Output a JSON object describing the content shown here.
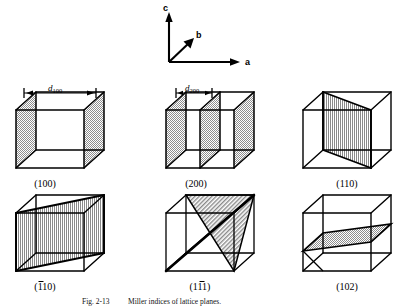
{
  "figure": {
    "caption_number": "Fig. 2-13",
    "caption_text": "Miller indices of lattice planes.",
    "background_color": "#ffffff",
    "line_color": "#000000",
    "shade_color": "#9a9a9a"
  },
  "axes": {
    "name": "crystallographic-axis-triad",
    "labels": {
      "a": "a",
      "b": "b",
      "c": "c"
    },
    "directions": {
      "a": "right",
      "b": "upper-right-oblique",
      "c": "up"
    }
  },
  "annotations": {
    "d100": {
      "symbol": "d",
      "subscript": "100",
      "span": "full-cell-width"
    },
    "d200": {
      "symbol": "d",
      "subscript": "200",
      "span": "half-cell-width"
    }
  },
  "cells": [
    {
      "id": "cell-100",
      "label": "(100)",
      "row": 1,
      "col": 1,
      "plane_count": 2,
      "plane_description": "two shaded faces perpendicular to a, at front-left and back-right side faces",
      "dimension_label": "d100"
    },
    {
      "id": "cell-200",
      "label": "(200)",
      "row": 1,
      "col": 2,
      "plane_count": 3,
      "plane_description": "three shaded planes perpendicular to a, spaced at half-cell intervals",
      "dimension_label": "d200"
    },
    {
      "id": "cell-110",
      "label": "(110)",
      "row": 1,
      "col": 3,
      "plane_count": 1,
      "plane_description": "single shaded diagonal plane cutting the cell from one vertical edge to the opposite vertical edge",
      "dimension_label": ""
    },
    {
      "id": "cell-1bar10",
      "label": "(̈1 1 0)",
      "label_display": "(110)",
      "bar_on_digit": 1,
      "row": 2,
      "col": 1,
      "plane_count": 1,
      "plane_description": "single shaded diagonal plane along the opposite diagonal of the cell",
      "dimension_label": ""
    },
    {
      "id": "cell-11bar1",
      "label": "(11̈1)",
      "label_display": "(111)",
      "bar_on_digit": 2,
      "row": 2,
      "col": 2,
      "plane_count": 2,
      "plane_description": "two shaded triangular plane segments meeting along a bold body diagonal",
      "dimension_label": ""
    },
    {
      "id": "cell-102",
      "label": "(102)",
      "row": 2,
      "col": 3,
      "plane_count": 1,
      "plane_description": "single shaded tilted parallelogram plane in the lower half of the cell",
      "dimension_label": ""
    }
  ]
}
